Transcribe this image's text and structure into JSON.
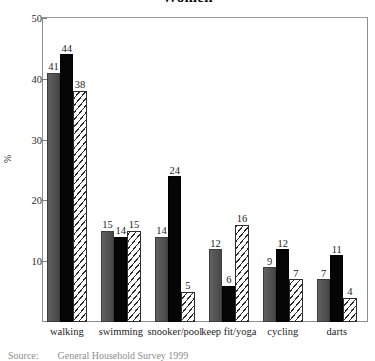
{
  "chart_data": {
    "type": "bar",
    "title": "Women",
    "xlabel": "",
    "ylabel": "%",
    "ylim": [
      0,
      50
    ],
    "yticks": [
      10,
      20,
      30,
      40,
      50
    ],
    "grid": false,
    "legend_position": "none",
    "categories": [
      "walking",
      "swimming",
      "snooker/pool",
      "keep fit/yoga",
      "cycling",
      "darts"
    ],
    "series": [
      {
        "name": "series-1",
        "style": "gray",
        "values": [
          41,
          15,
          14,
          12,
          9,
          7
        ]
      },
      {
        "name": "series-2",
        "style": "black",
        "values": [
          44,
          14,
          24,
          6,
          12,
          11
        ]
      },
      {
        "name": "series-3",
        "style": "hatch",
        "values": [
          38,
          15,
          5,
          16,
          7,
          4
        ]
      }
    ],
    "annotations": {
      "source_prefix": "Source:",
      "source_text": "General Household Survey 1999"
    }
  }
}
